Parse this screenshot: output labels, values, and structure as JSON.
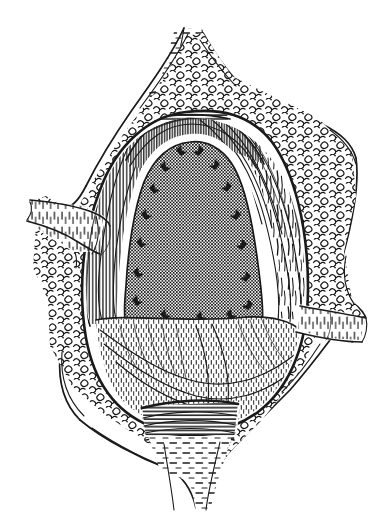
{
  "figure": {
    "kind": "anatomical-line-illustration",
    "medium": "pen-and-ink hatching engraving",
    "background_color": "#ffffff",
    "ink_color": "#1a1a1a",
    "width_px": 384,
    "height_px": 523,
    "caption": "",
    "labels": [],
    "callouts": []
  },
  "regions": [
    {
      "id": "top-tissue-band",
      "name": "superior retracted tissue band",
      "texture": "horizontal-hatch",
      "center": [
        186,
        100
      ]
    },
    {
      "id": "top-stalk",
      "name": "superior tapered stalk",
      "texture": "dashed-horizontal-hatch",
      "center": [
        186,
        55
      ]
    },
    {
      "id": "left-flap",
      "name": "left retracted flap",
      "texture": "short-dash-hatch",
      "center": [
        60,
        215
      ]
    },
    {
      "id": "right-flap",
      "name": "right retracted flap",
      "texture": "short-dash-hatch",
      "center": [
        330,
        325
      ]
    },
    {
      "id": "bottom-stalk",
      "name": "inferior tapered stalk",
      "texture": "dashed-horizontal-hatch",
      "center": [
        178,
        478
      ]
    },
    {
      "id": "bottom-tissue-band",
      "name": "inferior retracted tissue band",
      "texture": "horizontal-hatch",
      "center": [
        180,
        420
      ]
    },
    {
      "id": "fat-margin",
      "name": "subcutaneous fat margin",
      "texture": "nodular-lobules",
      "center": [
        192,
        262
      ]
    },
    {
      "id": "muscle-left",
      "name": "left muscle belly",
      "texture": "long-fiber-strokes",
      "center": [
        110,
        250
      ]
    },
    {
      "id": "muscle-right",
      "name": "right muscle belly",
      "texture": "long-fiber-strokes",
      "center": [
        258,
        240
      ]
    },
    {
      "id": "central-organ",
      "name": "central stippled structure",
      "texture": "dot-screen-crosshatch",
      "center": [
        190,
        230
      ]
    },
    {
      "id": "lower-fold",
      "name": "inferior folded tissue",
      "texture": "fine-vertical-stipple",
      "center": [
        190,
        350
      ]
    }
  ]
}
